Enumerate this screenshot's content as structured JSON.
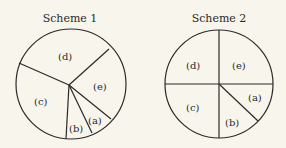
{
  "schemes": [
    {
      "title": "Scheme 1",
      "center": [
        70,
        85
      ],
      "radius": 55,
      "hub": [
        70,
        85
      ],
      "spokes_deg": [
        95,
        125,
        140,
        200,
        330
      ],
      "labels": [
        {
          "text": "(d)",
          "pos": [
            68,
            56
          ]
        },
        {
          "text": "(e)",
          "pos": [
            103,
            86
          ]
        },
        {
          "text": "(c)",
          "pos": [
            39,
            101
          ]
        },
        {
          "text": "(b)",
          "pos": [
            76,
            129
          ]
        },
        {
          "text": "(a)",
          "pos": [
            96,
            121
          ]
        }
      ]
    },
    {
      "title": "Scheme 2",
      "center": [
        219,
        84
      ],
      "radius": 54,
      "labels": [
        {
          "text": "(d)",
          "pos": [
            196,
            65
          ]
        },
        {
          "text": "(e)",
          "pos": [
            240,
            65
          ]
        },
        {
          "text": "(c)",
          "pos": [
            196,
            107
          ]
        },
        {
          "text": "(a)",
          "pos": [
            252,
            98
          ]
        },
        {
          "text": "(b)",
          "pos": [
            234,
            122
          ]
        }
      ]
    }
  ],
  "colors": {
    "stroke": "#2a2a2a",
    "background": "#f7f5ec"
  }
}
